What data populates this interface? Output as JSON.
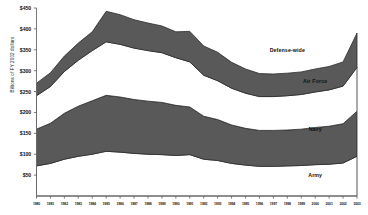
{
  "chart_data": {
    "type": "area",
    "stacked": true,
    "title": "",
    "xlabel": "",
    "ylabel": "Billions of FY 2002 dollars",
    "ylim": [
      0,
      450
    ],
    "yticks": [
      50,
      100,
      150,
      200,
      250,
      300,
      350,
      400,
      450
    ],
    "ytick_labels": [
      "$50",
      "$100",
      "$150",
      "$200",
      "$250",
      "$300",
      "$350",
      "$400",
      "$450"
    ],
    "grid": false,
    "legend_position": "inline-on-bands",
    "x": [
      1980,
      1981,
      1982,
      1983,
      1984,
      1985,
      1986,
      1987,
      1988,
      1989,
      1990,
      1991,
      1992,
      1993,
      1994,
      1995,
      1996,
      1997,
      1998,
      1999,
      2000,
      2001,
      2002,
      2003
    ],
    "xtick_labels": [
      "1980",
      "1981",
      "1982",
      "1983",
      "1984",
      "1985",
      "1986",
      "1987",
      "1988",
      "1989",
      "1990",
      "1991",
      "1992",
      "1993",
      "1994",
      "1995",
      "1996",
      "1997",
      "1998",
      "1999",
      "2000",
      "2001",
      "2002",
      "2003"
    ],
    "series": [
      {
        "name": "Army",
        "fill": "#ffffff",
        "label_color": "#111111",
        "values": [
          72,
          78,
          88,
          95,
          100,
          107,
          105,
          102,
          100,
          99,
          97,
          99,
          88,
          85,
          78,
          74,
          71,
          71,
          72,
          73,
          75,
          76,
          79,
          95
        ]
      },
      {
        "name": "Navy",
        "fill": "#595959",
        "label_color": "#111111",
        "values": [
          88,
          96,
          110,
          120,
          128,
          134,
          132,
          129,
          127,
          125,
          120,
          114,
          103,
          98,
          92,
          88,
          86,
          86,
          86,
          87,
          89,
          91,
          94,
          108
        ]
      },
      {
        "name": "Air Force",
        "fill": "#ffffff",
        "label_color": "#111111",
        "values": [
          80,
          88,
          100,
          110,
          120,
          128,
          126,
          123,
          121,
          119,
          114,
          108,
          98,
          93,
          88,
          84,
          81,
          81,
          82,
          83,
          85,
          87,
          90,
          105
        ]
      },
      {
        "name": "Defense-wide",
        "fill": "#595959",
        "label_color": "#111111",
        "values": [
          30,
          33,
          37,
          41,
          45,
          73,
          71,
          68,
          66,
          64,
          62,
          73,
          70,
          68,
          62,
          58,
          55,
          54,
          54,
          54,
          55,
          56,
          58,
          82
        ]
      }
    ],
    "series_label_positions": [
      {
        "name": "Army",
        "x": 2000,
        "y": 50
      },
      {
        "name": "Navy",
        "x": 2000,
        "y": 160
      },
      {
        "name": "Air Force",
        "x": 2000,
        "y": 275
      },
      {
        "name": "Defense-wide",
        "x": 1998,
        "y": 350
      }
    ]
  },
  "colors": {
    "band_dark": "#595959",
    "band_light": "#ffffff",
    "axis": "#6b6b6b",
    "outline": "#2b2b2b",
    "text": "#111111",
    "background": "#ffffff"
  }
}
